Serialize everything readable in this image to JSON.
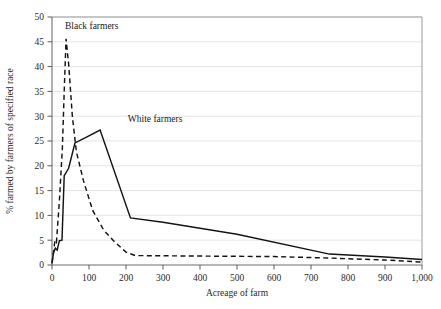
{
  "chart_data": {
    "type": "line",
    "title": "",
    "xlabel": "Acreage of farm",
    "ylabel": "% farmed by farmers of specified race",
    "xlim": [
      0,
      1000
    ],
    "ylim": [
      0,
      50
    ],
    "xticks": [
      0,
      100,
      200,
      300,
      400,
      500,
      600,
      700,
      800,
      900,
      1000
    ],
    "xtick_labels": [
      "0",
      "100",
      "200",
      "300",
      "400",
      "500",
      "600",
      "700",
      "800",
      "900",
      "1,000"
    ],
    "yticks": [
      0,
      5,
      10,
      15,
      20,
      25,
      30,
      35,
      40,
      45,
      50
    ],
    "ytick_labels": [
      "0",
      "5",
      "10",
      "15",
      "20",
      "25",
      "30",
      "35",
      "40",
      "45",
      "50"
    ],
    "grid": true,
    "grid_axis": "y",
    "legend_position": "inline-annotation",
    "series": [
      {
        "name": "Black farmers",
        "style": "dashed",
        "annotation": "Black farmers",
        "annotation_x": 35,
        "annotation_y": 47.5,
        "points": [
          [
            0,
            0.4
          ],
          [
            3,
            2.0
          ],
          [
            8,
            5.0
          ],
          [
            12,
            4.6
          ],
          [
            20,
            13.0
          ],
          [
            28,
            23.5
          ],
          [
            33,
            35.0
          ],
          [
            38,
            45.6
          ],
          [
            45,
            40.5
          ],
          [
            55,
            30.0
          ],
          [
            66,
            22.8
          ],
          [
            85,
            17.0
          ],
          [
            110,
            11.0
          ],
          [
            140,
            7.0
          ],
          [
            170,
            4.6
          ],
          [
            200,
            2.6
          ],
          [
            225,
            1.9
          ],
          [
            400,
            1.8
          ],
          [
            600,
            1.7
          ],
          [
            750,
            1.4
          ],
          [
            900,
            1.0
          ],
          [
            1000,
            0.6
          ]
        ]
      },
      {
        "name": "White farmers",
        "style": "solid",
        "annotation": "White farmers",
        "annotation_x": 205,
        "annotation_y": 28.8,
        "points": [
          [
            0,
            0.3
          ],
          [
            4,
            2.4
          ],
          [
            9,
            3.4
          ],
          [
            14,
            3.0
          ],
          [
            20,
            4.9
          ],
          [
            27,
            5.0
          ],
          [
            33,
            18.0
          ],
          [
            45,
            19.5
          ],
          [
            62,
            24.6
          ],
          [
            88,
            25.6
          ],
          [
            130,
            27.2
          ],
          [
            212,
            9.5
          ],
          [
            300,
            8.6
          ],
          [
            500,
            6.2
          ],
          [
            750,
            2.2
          ],
          [
            900,
            1.6
          ],
          [
            1000,
            1.1
          ]
        ]
      }
    ]
  },
  "annotations": {
    "black_farmers_label": "Black farmers",
    "white_farmers_label": "White farmers"
  }
}
